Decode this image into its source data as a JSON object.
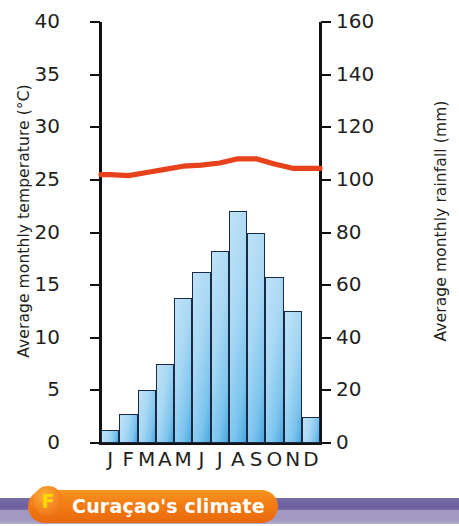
{
  "caption": {
    "badge_letter": "F",
    "title": "Curaçao's climate",
    "pill_color": "#f37c14",
    "band_color": "#6b5f9c",
    "badge_text_color": "#ffd900"
  },
  "chart_data": {
    "type": "bar",
    "title": "Curaçao's climate",
    "categories": [
      "J",
      "F",
      "M",
      "A",
      "M",
      "J",
      "J",
      "A",
      "S",
      "O",
      "N",
      "D"
    ],
    "month_names": [
      "January",
      "February",
      "March",
      "April",
      "May",
      "June",
      "July",
      "August",
      "September",
      "October",
      "November",
      "December"
    ],
    "xlabel": "",
    "grid": false,
    "legend": "none",
    "series": [
      {
        "name": "Average monthly rainfall (mm)",
        "type": "bar",
        "axis": "right",
        "color": "#9ad4f2",
        "edge_color": "#1b2a44",
        "values": [
          5,
          11,
          20,
          30,
          55,
          65,
          73,
          88,
          80,
          63,
          50,
          10
        ]
      },
      {
        "name": "Average monthly temperature (°C)",
        "type": "line",
        "axis": "left",
        "color": "#e8421d",
        "values": [
          25.5,
          25.4,
          25.7,
          26.0,
          26.3,
          26.4,
          26.6,
          27.0,
          27.0,
          26.5,
          26.1,
          26.1
        ]
      }
    ],
    "left_axis": {
      "label": "Average monthly temperature (°C)",
      "ylim": [
        0,
        40
      ],
      "ticks": [
        0,
        5,
        10,
        15,
        20,
        25,
        30,
        35,
        40
      ],
      "tick_labels": [
        "0",
        "5",
        "10",
        "15",
        "20",
        "25",
        "30",
        "35",
        "40"
      ]
    },
    "right_axis": {
      "label": "Average monthly rainfall (mm)",
      "ylim": [
        0,
        160
      ],
      "ticks": [
        0,
        20,
        40,
        60,
        80,
        100,
        120,
        140,
        160
      ],
      "tick_labels": [
        "0",
        "20",
        "40",
        "60",
        "80",
        "100",
        "120",
        "140",
        "160"
      ]
    }
  }
}
